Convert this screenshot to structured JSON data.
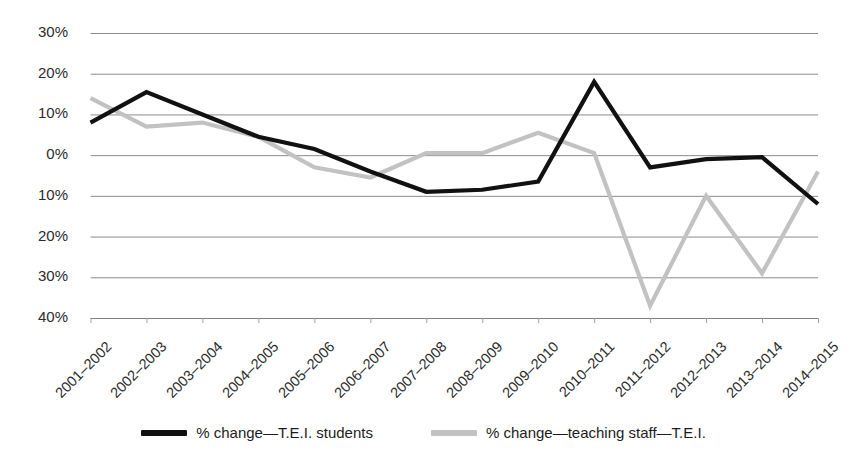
{
  "chart_data": {
    "type": "line",
    "title": "",
    "subtitle": "",
    "xlabel": "",
    "ylabel": "",
    "grid": true,
    "legend_position": "bottom",
    "ylim": [
      -40,
      30
    ],
    "ytick_step": 10,
    "ytick_labels": [
      "30%",
      "20%",
      "10%",
      "0%",
      "10%",
      "20%",
      "30%",
      "40%"
    ],
    "ytick_values": [
      30,
      20,
      10,
      0,
      -10,
      -20,
      -30,
      -40
    ],
    "categories": [
      "2001–2002",
      "2002–2003",
      "2003–2004",
      "2004–2005",
      "2005–2006",
      "2006–2007",
      "2007–2008",
      "2008–2009",
      "2009–2010",
      "2010–2011",
      "2011–2012",
      "2012–2013",
      "2013–2014",
      "2014–2015"
    ],
    "series": [
      {
        "name": "% change—T.E.I. students",
        "color": "#111111",
        "values": [
          8,
          15.5,
          10,
          4.5,
          1.5,
          -4,
          -9,
          -8.5,
          -6.5,
          18,
          -3,
          -1,
          -0.5,
          -12
        ]
      },
      {
        "name": "% change—teaching staff—T.E.I.",
        "color": "#c2c2c2",
        "values": [
          14,
          7,
          8,
          4.5,
          -3,
          -5.5,
          0.5,
          0.5,
          5.5,
          0.5,
          -37,
          -10,
          -29,
          -4
        ]
      }
    ]
  },
  "legend": {
    "items": [
      {
        "label": "% change—T.E.I. students",
        "color": "#111111",
        "swatch_name": "legend-swatch-students"
      },
      {
        "label": "% change—teaching staff—T.E.I.",
        "color": "#c2c2c2",
        "swatch_name": "legend-swatch-staff"
      }
    ]
  },
  "style": {
    "gridline_color": "#7f7f7f",
    "axis_text_color": "#2b2b2b",
    "background": "#ffffff"
  }
}
